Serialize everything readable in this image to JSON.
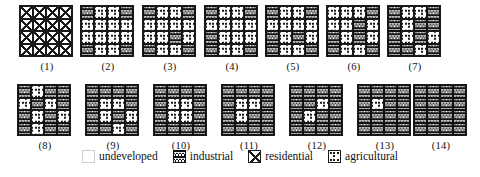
{
  "figure": {
    "title": "",
    "grid_size": 4,
    "legend": {
      "items": [
        {
          "key": "undeveloped",
          "label": "undeveloped",
          "swatch": "swatch-undeveloped",
          "color": "#ffffff"
        },
        {
          "key": "industrial",
          "label": "industrial",
          "swatch": "swatch-industrial",
          "color": "#151515"
        },
        {
          "key": "residential",
          "label": "residential",
          "swatch": "swatch-residential",
          "color": "#ffffff"
        },
        {
          "key": "agricultural",
          "label": "agricultural",
          "swatch": "swatch-agricultural",
          "color": "#ffffff"
        }
      ]
    },
    "panels": [
      {
        "label": "(1)",
        "cells": [
          "residential",
          "residential",
          "residential",
          "residential",
          "residential",
          "residential",
          "residential",
          "residential",
          "residential",
          "residential",
          "residential",
          "residential",
          "residential",
          "residential",
          "residential",
          "residential"
        ]
      },
      {
        "label": "(2)",
        "cells": [
          "industrial",
          "agricultural",
          "agricultural",
          "industrial",
          "agricultural",
          "agricultural",
          "agricultural",
          "agricultural",
          "agricultural",
          "agricultural",
          "agricultural",
          "agricultural",
          "industrial",
          "agricultural",
          "agricultural",
          "industrial"
        ]
      },
      {
        "label": "(3)",
        "cells": [
          "industrial",
          "agricultural",
          "agricultural",
          "industrial",
          "agricultural",
          "agricultural",
          "agricultural",
          "agricultural",
          "agricultural",
          "agricultural",
          "industrial",
          "agricultural",
          "industrial",
          "agricultural",
          "agricultural",
          "industrial"
        ]
      },
      {
        "label": "(4)",
        "cells": [
          "industrial",
          "agricultural",
          "agricultural",
          "industrial",
          "agricultural",
          "agricultural",
          "agricultural",
          "agricultural",
          "industrial",
          "agricultural",
          "agricultural",
          "agricultural",
          "industrial",
          "agricultural",
          "agricultural",
          "industrial"
        ]
      },
      {
        "label": "(5)",
        "cells": [
          "industrial",
          "agricultural",
          "agricultural",
          "industrial",
          "agricultural",
          "agricultural",
          "agricultural",
          "agricultural",
          "industrial",
          "agricultural",
          "industrial",
          "agricultural",
          "industrial",
          "agricultural",
          "agricultural",
          "industrial"
        ]
      },
      {
        "label": "(6)",
        "cells": [
          "agricultural",
          "agricultural",
          "agricultural",
          "industrial",
          "agricultural",
          "agricultural",
          "industrial",
          "agricultural",
          "industrial",
          "agricultural",
          "industrial",
          "agricultural",
          "industrial",
          "agricultural",
          "agricultural",
          "industrial"
        ]
      },
      {
        "label": "(7)",
        "cells": [
          "industrial",
          "agricultural",
          "agricultural",
          "industrial",
          "industrial",
          "agricultural",
          "industrial",
          "industrial",
          "industrial",
          "agricultural",
          "industrial",
          "agricultural",
          "industrial",
          "industrial",
          "agricultural",
          "industrial"
        ]
      },
      {
        "label": "(8)",
        "cells": [
          "industrial",
          "agricultural",
          "industrial",
          "industrial",
          "agricultural",
          "industrial",
          "agricultural",
          "industrial",
          "industrial",
          "agricultural",
          "industrial",
          "agricultural",
          "industrial",
          "agricultural",
          "industrial",
          "industrial"
        ]
      },
      {
        "label": "(9)",
        "cells": [
          "industrial",
          "industrial",
          "industrial",
          "industrial",
          "industrial",
          "agricultural",
          "agricultural",
          "industrial",
          "industrial",
          "agricultural",
          "industrial",
          "agricultural",
          "industrial",
          "industrial",
          "agricultural",
          "industrial"
        ]
      },
      {
        "label": "(10)",
        "cells": [
          "industrial",
          "industrial",
          "industrial",
          "industrial",
          "industrial",
          "agricultural",
          "agricultural",
          "industrial",
          "industrial",
          "agricultural",
          "agricultural",
          "industrial",
          "industrial",
          "industrial",
          "industrial",
          "industrial"
        ]
      },
      {
        "label": "(11)",
        "cells": [
          "industrial",
          "industrial",
          "industrial",
          "industrial",
          "industrial",
          "agricultural",
          "agricultural",
          "industrial",
          "industrial",
          "agricultural",
          "industrial",
          "industrial",
          "industrial",
          "industrial",
          "industrial",
          "industrial"
        ]
      },
      {
        "label": "(12)",
        "cells": [
          "industrial",
          "industrial",
          "industrial",
          "industrial",
          "industrial",
          "industrial",
          "agricultural",
          "industrial",
          "industrial",
          "agricultural",
          "industrial",
          "industrial",
          "industrial",
          "industrial",
          "industrial",
          "industrial"
        ]
      },
      {
        "label": "(13)",
        "cells": [
          "industrial",
          "industrial",
          "industrial",
          "industrial",
          "industrial",
          "agricultural",
          "industrial",
          "industrial",
          "industrial",
          "industrial",
          "industrial",
          "industrial",
          "industrial",
          "industrial",
          "industrial",
          "industrial"
        ]
      },
      {
        "label": "(14)",
        "cells": [
          "industrial",
          "industrial",
          "industrial",
          "industrial",
          "industrial",
          "industrial",
          "industrial",
          "industrial",
          "industrial",
          "industrial",
          "industrial",
          "industrial",
          "industrial",
          "industrial",
          "industrial",
          "industrial"
        ]
      }
    ]
  }
}
